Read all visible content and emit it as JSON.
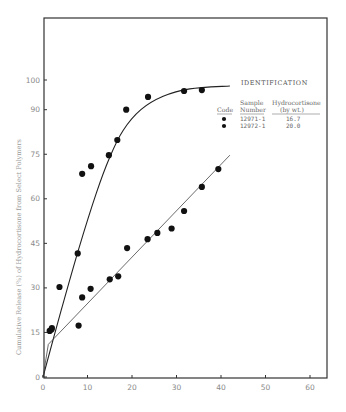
{
  "chart_data": {
    "type": "scatter",
    "title": "",
    "xlabel": "",
    "ylabel": "Cumulative Release (%) of Hydrocortisone from Select Polymers",
    "xlim": [
      0,
      64
    ],
    "ylim": [
      0,
      112
    ],
    "x_ticks": [
      0,
      10,
      20,
      30,
      40,
      50,
      60
    ],
    "y_ticks": [
      0,
      15,
      30,
      45,
      60,
      75,
      90,
      100
    ],
    "grid": false,
    "legend_position": "upper right",
    "legend": {
      "title": "IDENTIFICATION",
      "headers": [
        "Code",
        "Sample Number",
        "Hydrocortisone (by wt.)"
      ],
      "rows": [
        {
          "code": "filled-circle",
          "sample_number": "12971-1",
          "hydrocortisone": "16.7"
        },
        {
          "code": "filled-circle",
          "sample_number": "12972-1",
          "hydrocortisone": "20.0"
        }
      ]
    },
    "series": [
      {
        "name": "12972-1 (20.0% hydrocortisone)",
        "marker": "filled-circle",
        "points": [
          {
            "x": 1.5,
            "y": 15.5
          },
          {
            "x": 2.0,
            "y": 16.5
          },
          {
            "x": 3.7,
            "y": 30.3
          },
          {
            "x": 7.8,
            "y": 41.6
          },
          {
            "x": 8.8,
            "y": 68.4
          },
          {
            "x": 10.8,
            "y": 71.0
          },
          {
            "x": 14.8,
            "y": 74.7
          },
          {
            "x": 16.7,
            "y": 79.8
          },
          {
            "x": 18.7,
            "y": 90.0
          },
          {
            "x": 23.6,
            "y": 94.3
          },
          {
            "x": 31.7,
            "y": 96.3
          },
          {
            "x": 35.7,
            "y": 96.6
          }
        ],
        "fit_curve": [
          {
            "x": 0,
            "y": 0
          },
          {
            "x": 4,
            "y": 22
          },
          {
            "x": 8,
            "y": 43
          },
          {
            "x": 12,
            "y": 62
          },
          {
            "x": 15,
            "y": 74
          },
          {
            "x": 18,
            "y": 83
          },
          {
            "x": 22,
            "y": 90
          },
          {
            "x": 27,
            "y": 94.5
          },
          {
            "x": 33,
            "y": 97
          },
          {
            "x": 42,
            "y": 98
          }
        ]
      },
      {
        "name": "12971-1 (16.7% hydrocortisone)",
        "marker": "filled-circle",
        "points": [
          {
            "x": 1.9,
            "y": 16.0
          },
          {
            "x": 8.0,
            "y": 17.3
          },
          {
            "x": 8.8,
            "y": 26.8
          },
          {
            "x": 10.7,
            "y": 29.7
          },
          {
            "x": 15.0,
            "y": 32.9
          },
          {
            "x": 16.9,
            "y": 33.9
          },
          {
            "x": 18.9,
            "y": 43.4
          },
          {
            "x": 23.5,
            "y": 46.4
          },
          {
            "x": 25.7,
            "y": 48.5
          },
          {
            "x": 28.9,
            "y": 50.0
          },
          {
            "x": 31.7,
            "y": 55.9
          },
          {
            "x": 35.7,
            "y": 64.0
          },
          {
            "x": 39.4,
            "y": 70.0
          }
        ],
        "fit_curve": [
          {
            "x": 0,
            "y": 0
          },
          {
            "x": 1.2,
            "y": 11
          },
          {
            "x": 42,
            "y": 74.7
          }
        ]
      }
    ]
  },
  "axes": {
    "x_tick_labels": [
      "0",
      "10",
      "20",
      "30",
      "40",
      "50",
      "60"
    ],
    "y_tick_labels": [
      "0",
      "15",
      "30",
      "45",
      "60",
      "75",
      "90",
      "100"
    ]
  }
}
